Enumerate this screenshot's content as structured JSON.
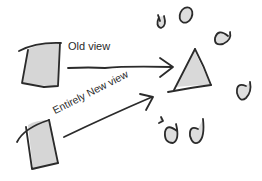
{
  "diagram": {
    "labels": {
      "old_view": "Old view",
      "new_view": "Entirely New view"
    },
    "shapes": {
      "fill": "#d9d9d9",
      "stroke": "#2b2b2b"
    },
    "elements": [
      {
        "type": "quad",
        "name": "old-view-panel"
      },
      {
        "type": "quad",
        "name": "new-view-panel"
      },
      {
        "type": "arrow",
        "name": "old-view-arrow"
      },
      {
        "type": "arrow",
        "name": "new-view-arrow"
      },
      {
        "type": "triangle",
        "name": "cone"
      },
      {
        "type": "blobs",
        "count": 7
      }
    ]
  }
}
